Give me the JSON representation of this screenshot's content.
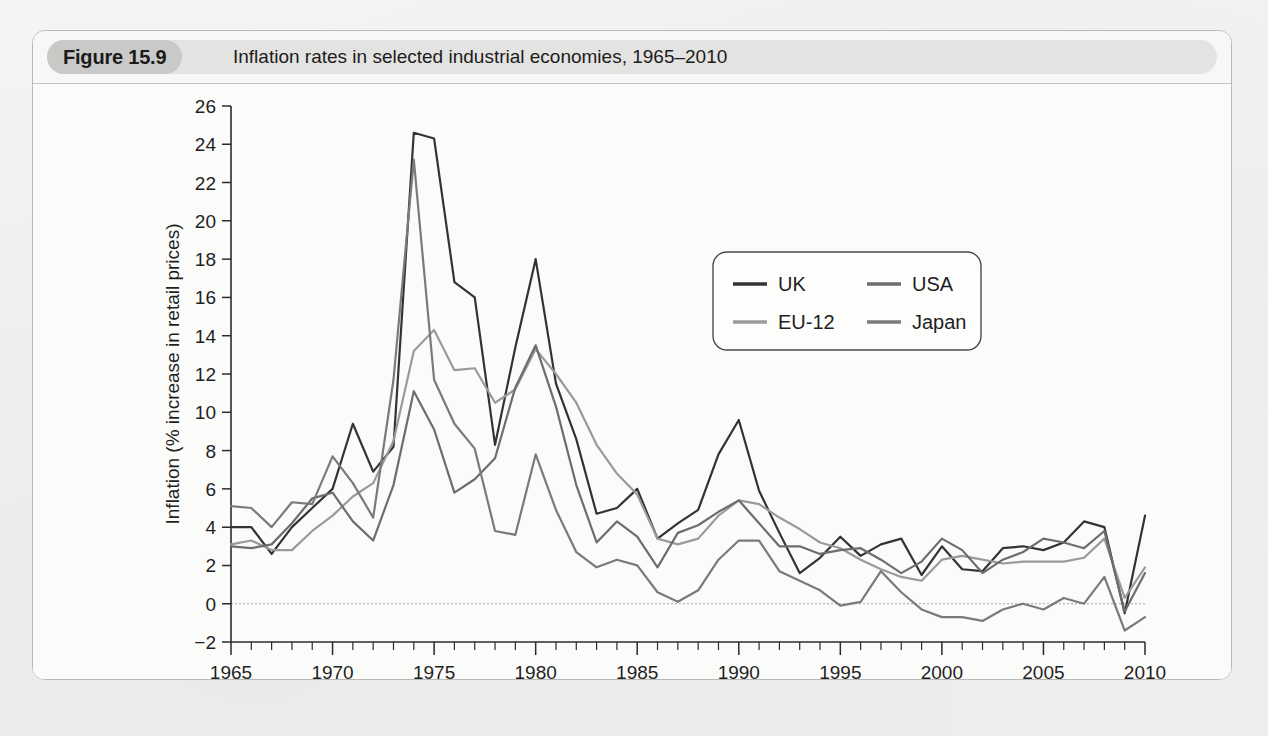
{
  "figure": {
    "label": "Figure 15.9",
    "title": "Inflation rates in selected industrial economies, 1965–2010"
  },
  "chart_data": {
    "type": "line",
    "title": "Inflation rates in selected industrial economies, 1965–2010",
    "xlabel": "",
    "ylabel": "Inflation (% increase in retail prices)",
    "xlim": [
      1965,
      2010
    ],
    "ylim": [
      -2,
      26
    ],
    "ytick_step": 2,
    "yticks": [
      -2,
      0,
      2,
      4,
      6,
      8,
      10,
      12,
      14,
      16,
      18,
      20,
      22,
      24,
      26
    ],
    "xticks_major": [
      1965,
      1970,
      1975,
      1980,
      1985,
      1990,
      1995,
      2000,
      2005,
      2010
    ],
    "xtick_minor_step": 1,
    "grid": false,
    "zero_line": true,
    "legend_position": "upper-center-right",
    "x": [
      1965,
      1966,
      1967,
      1968,
      1969,
      1970,
      1971,
      1972,
      1973,
      1974,
      1975,
      1976,
      1977,
      1978,
      1979,
      1980,
      1981,
      1982,
      1983,
      1984,
      1985,
      1986,
      1987,
      1988,
      1989,
      1990,
      1991,
      1992,
      1993,
      1994,
      1995,
      1996,
      1997,
      1998,
      1999,
      2000,
      2001,
      2002,
      2003,
      2004,
      2005,
      2006,
      2007,
      2008,
      2009,
      2010
    ],
    "series": [
      {
        "name": "UK",
        "color": "#333333",
        "values": [
          4.0,
          4.0,
          2.6,
          4.0,
          5.0,
          6.0,
          9.4,
          6.9,
          8.2,
          24.6,
          24.3,
          16.8,
          16.0,
          8.3,
          13.4,
          18.0,
          11.5,
          8.6,
          4.7,
          5.0,
          6.0,
          3.4,
          4.2,
          4.9,
          7.8,
          9.6,
          5.9,
          3.7,
          1.6,
          2.4,
          3.5,
          2.5,
          3.1,
          3.4,
          1.5,
          3.0,
          1.8,
          1.7,
          2.9,
          3.0,
          2.8,
          3.2,
          4.3,
          4.0,
          -0.5,
          4.6
        ]
      },
      {
        "name": "EU-12",
        "color": "#9a9a9a",
        "values": [
          3.1,
          3.3,
          2.8,
          2.8,
          3.8,
          4.6,
          5.6,
          6.3,
          8.5,
          13.2,
          14.3,
          12.2,
          12.3,
          10.5,
          11.2,
          13.3,
          12.0,
          10.5,
          8.3,
          6.8,
          5.7,
          3.4,
          3.1,
          3.4,
          4.6,
          5.4,
          5.2,
          4.5,
          3.9,
          3.2,
          2.9,
          2.3,
          1.8,
          1.4,
          1.2,
          2.3,
          2.5,
          2.3,
          2.1,
          2.2,
          2.2,
          2.2,
          2.4,
          3.4,
          0.3,
          1.9
        ]
      },
      {
        "name": "USA",
        "color": "#6d6d6d",
        "values": [
          3.0,
          2.9,
          3.1,
          4.2,
          5.5,
          5.8,
          4.3,
          3.3,
          6.2,
          11.1,
          9.1,
          5.8,
          6.5,
          7.6,
          11.3,
          13.5,
          10.3,
          6.2,
          3.2,
          4.3,
          3.5,
          1.9,
          3.7,
          4.1,
          4.8,
          5.4,
          4.2,
          3.0,
          3.0,
          2.6,
          2.8,
          2.9,
          2.3,
          1.6,
          2.2,
          3.4,
          2.8,
          1.6,
          2.3,
          2.7,
          3.4,
          3.2,
          2.9,
          3.8,
          -0.4,
          1.6
        ]
      },
      {
        "name": "Japan",
        "color": "#7a7a7a",
        "values": [
          5.1,
          5.0,
          4.0,
          5.3,
          5.2,
          7.7,
          6.3,
          4.5,
          11.7,
          23.2,
          11.7,
          9.4,
          8.1,
          3.8,
          3.6,
          7.8,
          4.9,
          2.7,
          1.9,
          2.3,
          2.0,
          0.6,
          0.1,
          0.7,
          2.3,
          3.3,
          3.3,
          1.7,
          1.2,
          0.7,
          -0.1,
          0.1,
          1.7,
          0.6,
          -0.3,
          -0.7,
          -0.7,
          -0.9,
          -0.3,
          0.0,
          -0.3,
          0.3,
          0.0,
          1.4,
          -1.4,
          -0.7
        ]
      }
    ]
  },
  "legend": {
    "items": [
      {
        "label": "UK",
        "color": "#333333"
      },
      {
        "label": "USA",
        "color": "#6d6d6d"
      },
      {
        "label": "EU-12",
        "color": "#9a9a9a"
      },
      {
        "label": "Japan",
        "color": "#7a7a7a"
      }
    ]
  }
}
